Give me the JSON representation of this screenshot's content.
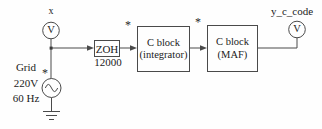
{
  "diagram": {
    "input_probe": {
      "label": "x",
      "meter": "V"
    },
    "source": {
      "name_lines": [
        "Grid",
        "220V",
        "60 Hz"
      ]
    },
    "zoh_block": {
      "label": "ZOH",
      "sample_rate": "12000"
    },
    "integrator_block": {
      "line1": "C block",
      "line2": "(integrator)"
    },
    "maf_block": {
      "line1": "C block",
      "line2": "(MAF)"
    },
    "output_probe": {
      "label": "y_c_code",
      "meter": "V"
    },
    "markers": {
      "asterisk": "*"
    },
    "colors": {
      "wire": "#4a4a4a",
      "ink": "#1b1b1b",
      "background": "#fefefe"
    }
  }
}
